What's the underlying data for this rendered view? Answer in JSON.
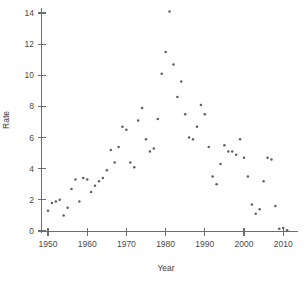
{
  "figure": {
    "background_color": "#ffffff",
    "point_color": "#5d5d66",
    "axis_color": "#6e6e6e",
    "text_color": "#4a4a4a"
  },
  "axes": {
    "x_title": "Year",
    "y_title": "Rate",
    "x_ticks": [
      "1950",
      "1960",
      "1970",
      "1980",
      "1990",
      "2000",
      "2010"
    ],
    "y_ticks": [
      "0",
      "2",
      "4",
      "6",
      "8",
      "10",
      "12",
      "14"
    ]
  },
  "chart_data": {
    "type": "scatter",
    "title": "",
    "xlabel": "Year",
    "ylabel": "Rate",
    "xlim": [
      1948,
      2012
    ],
    "ylim": [
      0,
      14.4
    ],
    "xticks": [
      1950,
      1960,
      1970,
      1980,
      1990,
      2000,
      2010
    ],
    "yticks": [
      0,
      2,
      4,
      6,
      8,
      10,
      12,
      14
    ],
    "grid": false,
    "legend": "none",
    "marker": "dot",
    "x": [
      1950,
      1951,
      1952,
      1953,
      1954,
      1955,
      1956,
      1957,
      1958,
      1959,
      1960,
      1961,
      1962,
      1963,
      1964,
      1965,
      1966,
      1967,
      1968,
      1969,
      1970,
      1971,
      1972,
      1973,
      1974,
      1975,
      1976,
      1977,
      1978,
      1979,
      1980,
      1981,
      1982,
      1983,
      1984,
      1985,
      1986,
      1987,
      1988,
      1989,
      1990,
      1991,
      1992,
      1993,
      1994,
      1995,
      1996,
      1997,
      1998,
      1999,
      2000,
      2001,
      2002,
      2003,
      2004,
      2005,
      2006,
      2007,
      2008,
      2009,
      2010,
      2011
    ],
    "y": [
      1.3,
      1.8,
      1.9,
      2.0,
      1.0,
      1.5,
      2.7,
      3.3,
      1.9,
      3.4,
      3.3,
      2.5,
      2.9,
      3.2,
      3.4,
      3.9,
      5.2,
      4.4,
      5.4,
      6.7,
      6.5,
      4.4,
      4.1,
      7.1,
      7.9,
      5.9,
      5.1,
      5.3,
      7.2,
      10.1,
      11.5,
      14.1,
      10.7,
      8.6,
      9.6,
      7.5,
      6.0,
      5.9,
      6.7,
      8.1,
      7.5,
      5.4,
      3.5,
      3.0,
      4.3,
      5.5,
      5.1,
      5.1,
      4.9,
      5.9,
      4.7,
      3.5,
      1.7,
      1.1,
      1.4,
      3.2,
      4.7,
      4.6,
      1.6,
      0.15,
      0.2,
      0.05
    ],
    "series_name": "Rate by year",
    "n_points": 62,
    "peak": {
      "x": 1981,
      "y": 14.1
    },
    "min": {
      "x": 2011,
      "y": 0.05
    }
  }
}
